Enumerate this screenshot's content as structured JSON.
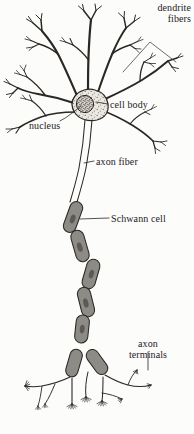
{
  "figure": {
    "background_color": "#fcfcfb",
    "ink_color": "#2b2722",
    "myelin_fill": "#8d8b86",
    "myelin_nucleus_fill": "#5d5a55",
    "soma_fill": "#d8d5cf",
    "label_color": "#25211e"
  },
  "labels": {
    "dendrite_fibers": "dendrite\nfibers",
    "dendrite_fibers_line1": "dendrite",
    "dendrite_fibers_line2": "fibers",
    "cell_body": "cell body",
    "nucleus": "nucleus",
    "axon_fiber": "axon fiber",
    "schwann_cell": "Schwann cell",
    "axon_terminals_line1": "axon",
    "axon_terminals_line2": "terminals"
  },
  "parts": [
    {
      "id": "dendrites",
      "name": "dendrite fibers",
      "count": 7
    },
    {
      "id": "soma",
      "name": "cell body"
    },
    {
      "id": "nucleus",
      "name": "nucleus"
    },
    {
      "id": "axon",
      "name": "axon fiber"
    },
    {
      "id": "myelin",
      "name": "Schwann cell",
      "segments": 11
    },
    {
      "id": "terminals",
      "name": "axon terminals",
      "count": 6
    }
  ]
}
